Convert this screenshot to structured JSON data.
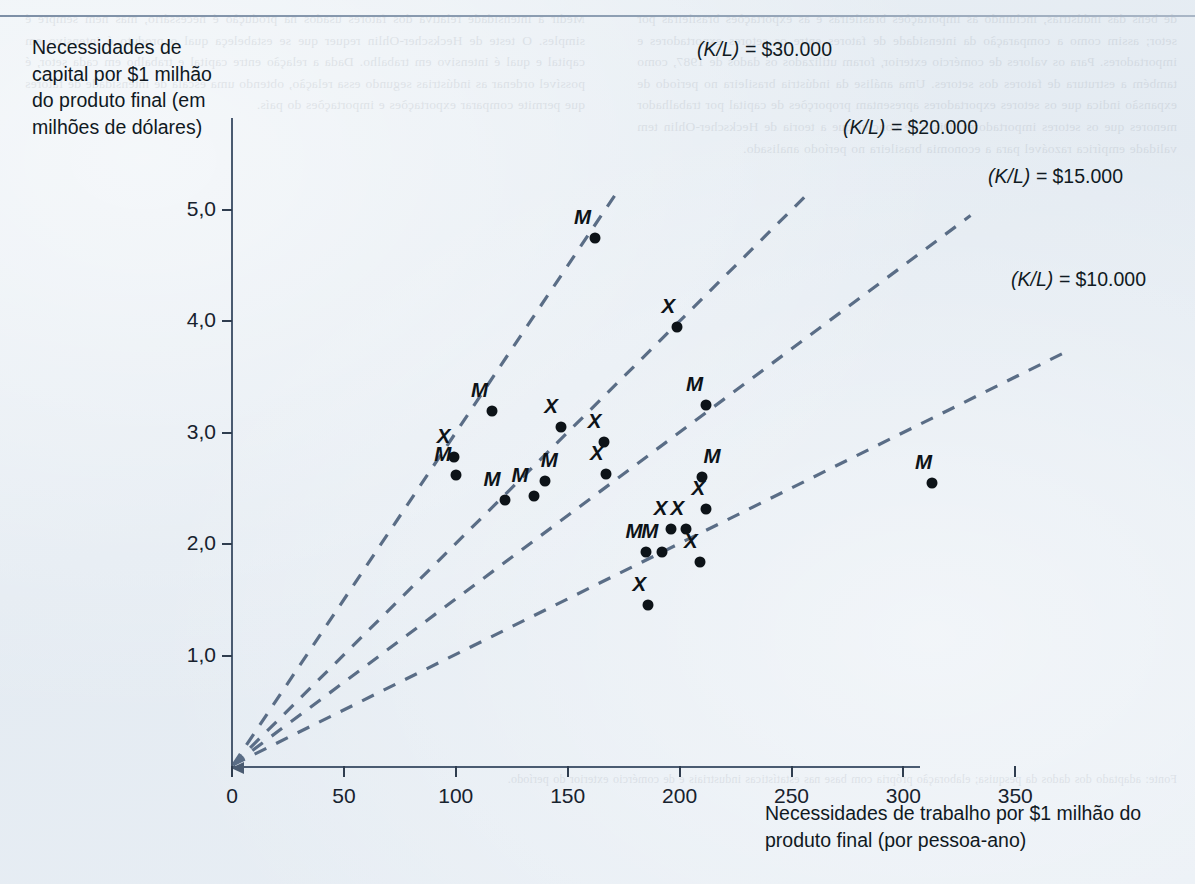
{
  "figure": {
    "background_color": "#e8eef4",
    "axis_color": "#4a5b71",
    "marker_color": "#0d1318",
    "ray_color": "#5a6d86"
  },
  "axes": {
    "y_title": "Necessidades de capital por $1 milhão do produto final (em milhões de dólares)",
    "x_title": "Necessidades de trabalho por $1 milhão do produto final (por pessoa-ano)",
    "y_ticks": [
      "1,0",
      "2,0",
      "3,0",
      "4,0",
      "5,0"
    ],
    "x_ticks": [
      "0",
      "50",
      "100",
      "150",
      "200",
      "250",
      "300",
      "350"
    ]
  },
  "rays": [
    {
      "label_prefix": "(K/L) = ",
      "label_value": "$30.000"
    },
    {
      "label_prefix": "(K/L) = ",
      "label_value": "$20.000"
    },
    {
      "label_prefix": "(K/L) = ",
      "label_value": "$15.000"
    },
    {
      "label_prefix": "(K/L) = ",
      "label_value": "$10.000"
    }
  ],
  "ghost_text": {
    "left": "de bens das indústrias, incluindo as importações brasileiras e as exportações brasileiras por setor; assim como a comparação da intensidade de fatores entre os setores exportadores e importadores. Para os valores de comércio exterior, foram utilizados os dados de 1987, como também a estrutura de fatores dos setores. Uma análise da indústria brasileira no período de expansão indica que os setores exportadores apresentam proporções de capital por trabalhador menores que os setores importadores. Disso se conclui que a teoria de Heckscher-Ohlin tem validade empírica razoável para a economia brasileira no período analisado.",
    "right": "Medir a intensidade relativa dos fatores usados na produção é necessário, mas nem sempre é simples. O teste de Heckscher-Ohlin requer que se estabeleça qual o produto é intensivo em capital e qual é intensivo em trabalho. Dada a relação entre capital e trabalho em cada setor, é possível ordenar as indústrias segundo essa relação, obtendo uma escala de intensidade de fatores que permite comparar exportações e importações do país.",
    "bottom": "Fonte: adaptado dos dados da pesquisa; elaboração própria com base nas estatísticas industriais e de comércio exterior do período."
  },
  "chart_data": {
    "type": "scatter",
    "title": "",
    "xlabel": "Necessidades de trabalho por $1 milhão do produto final (por pessoa-ano)",
    "ylabel": "Necessidades de capital por $1 milhão do produto final (em milhões de dólares)",
    "xlim": [
      0,
      375
    ],
    "ylim": [
      0,
      5.4
    ],
    "grid": false,
    "legend": "none",
    "xticks": [
      0,
      50,
      100,
      150,
      200,
      250,
      300,
      350
    ],
    "yticks": [
      1.0,
      2.0,
      3.0,
      4.0,
      5.0
    ],
    "point_label_meaning": {
      "M": "setor substituidor de importações",
      "X": "setor exportador"
    },
    "reference_lines": [
      {
        "label": "(K/L) = $30.000",
        "slope_k_per_l": 30000,
        "y_per_x": 0.03
      },
      {
        "label": "(K/L) = $20.000",
        "slope_k_per_l": 20000,
        "y_per_x": 0.02
      },
      {
        "label": "(K/L) = $15.000",
        "slope_k_per_l": 15000,
        "y_per_x": 0.015
      },
      {
        "label": "(K/L) = $10.000",
        "slope_k_per_l": 10000,
        "y_per_x": 0.01
      }
    ],
    "points": [
      {
        "label": "M",
        "x": 100,
        "y": 2.62
      },
      {
        "label": "X",
        "x": 99,
        "y": 2.78
      },
      {
        "label": "M",
        "x": 116,
        "y": 3.2
      },
      {
        "label": "M",
        "x": 122,
        "y": 2.4
      },
      {
        "label": "M",
        "x": 135,
        "y": 2.43
      },
      {
        "label": "M",
        "x": 140,
        "y": 2.57
      },
      {
        "label": "X",
        "x": 147,
        "y": 3.05
      },
      {
        "label": "M",
        "x": 162,
        "y": 4.75
      },
      {
        "label": "X",
        "x": 167,
        "y": 2.63
      },
      {
        "label": "X",
        "x": 166,
        "y": 2.92
      },
      {
        "label": "M",
        "x": 185,
        "y": 1.93
      },
      {
        "label": "M",
        "x": 192,
        "y": 1.93
      },
      {
        "label": "X",
        "x": 186,
        "y": 1.45
      },
      {
        "label": "X",
        "x": 199,
        "y": 3.95
      },
      {
        "label": "X",
        "x": 196,
        "y": 2.14
      },
      {
        "label": "X",
        "x": 203,
        "y": 2.14
      },
      {
        "label": "M",
        "x": 212,
        "y": 3.25
      },
      {
        "label": "M",
        "x": 210,
        "y": 2.6
      },
      {
        "label": "X",
        "x": 212,
        "y": 2.32
      },
      {
        "label": "X",
        "x": 209,
        "y": 1.84
      },
      {
        "label": "M",
        "x": 313,
        "y": 2.55
      }
    ]
  }
}
